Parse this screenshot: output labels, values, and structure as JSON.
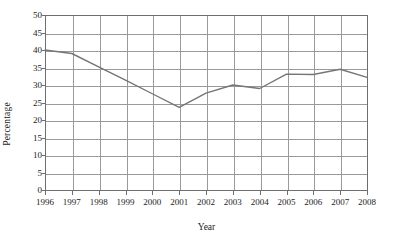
{
  "chart_data": {
    "type": "line",
    "title": "",
    "xlabel": "Year",
    "ylabel": "Percentage",
    "categories": [
      "1996",
      "1997",
      "1998",
      "1999",
      "2000",
      "2001",
      "2002",
      "2003",
      "2004",
      "2005",
      "2006",
      "2007",
      "2008"
    ],
    "values": [
      40,
      39,
      35.2,
      31.4,
      27.5,
      23.6,
      27.7,
      30,
      29,
      33.1,
      33,
      34.5,
      32.2
    ],
    "series": [
      {
        "name": "Percentage",
        "values": [
          40,
          39,
          35.2,
          31.4,
          27.5,
          23.6,
          27.7,
          30,
          29,
          33.1,
          33,
          34.5,
          32.2
        ]
      }
    ],
    "xlim": [
      "1996",
      "2008"
    ],
    "ylim": [
      0,
      50
    ],
    "ytick_values": [
      0,
      5,
      10,
      15,
      20,
      25,
      30,
      35,
      40,
      45,
      50
    ],
    "ytick_labels": [
      "0",
      "5",
      "10",
      "15",
      "20",
      "25",
      "30",
      "35",
      "40",
      "45",
      "50"
    ],
    "xtick_labels": [
      "1996",
      "1997",
      "1998",
      "1999",
      "2000",
      "2001",
      "2002",
      "2003",
      "2004",
      "2005",
      "2006",
      "2007",
      "2008"
    ],
    "grid": true,
    "grid_axes": "both",
    "legend": false,
    "legend_position": "none",
    "line_color": "#767676",
    "grid_color": "#9a9a9a",
    "frame_color": "#6f6f6f",
    "background_color": "#ffffff",
    "annotations": []
  }
}
